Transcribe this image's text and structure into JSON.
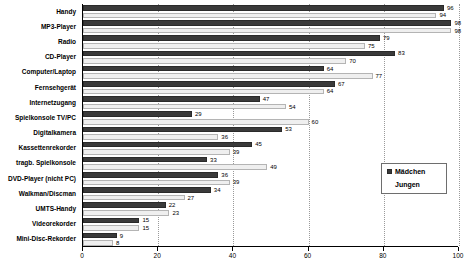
{
  "chart_data": {
    "type": "bar",
    "orientation": "horizontal",
    "title": "",
    "xlabel": "",
    "ylabel": "",
    "xlim": [
      0,
      100
    ],
    "xticks": [
      0,
      20,
      40,
      60,
      80,
      100
    ],
    "grid": true,
    "legend_position": "right",
    "categories": [
      "Handy",
      "MP3-Player",
      "Radio",
      "CD-Player",
      "Computer/Laptop",
      "Fernsehgerät",
      "Internetzugang",
      "Spielkonsole TV/PC",
      "Digitalkamera",
      "Kassettenrekorder",
      "tragb. Spielkonsole",
      "DVD-Player (nicht PC)",
      "Walkman/Discman",
      "UMTS-Handy",
      "Videorekorder",
      "Mini-Disc-Rekorder"
    ],
    "series": [
      {
        "name": "Mädchen",
        "color": "#3a3a3a",
        "values": [
          96,
          98,
          79,
          83,
          64,
          67,
          47,
          29,
          53,
          45,
          33,
          36,
          34,
          22,
          15,
          9
        ]
      },
      {
        "name": "Jungen",
        "color": "#efefef",
        "values": [
          94,
          98,
          75,
          70,
          77,
          64,
          54,
          60,
          36,
          39,
          49,
          39,
          27,
          23,
          15,
          8
        ]
      }
    ]
  },
  "legend": {
    "items": [
      {
        "label": "Mädchen",
        "swatch": "maedchen"
      },
      {
        "label": "Jungen",
        "swatch": "jungen"
      }
    ]
  }
}
